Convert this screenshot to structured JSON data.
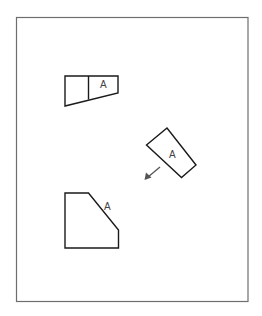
{
  "diagram": {
    "type": "orthographic-views",
    "labels": {
      "top_view_face": "A",
      "auxiliary_view_face": "A",
      "front_view_edge": "A"
    },
    "colors": {
      "frame": "#6e6e6e",
      "lines": "#1a1a1a",
      "text": "#444444",
      "arrow": "#555555"
    }
  }
}
